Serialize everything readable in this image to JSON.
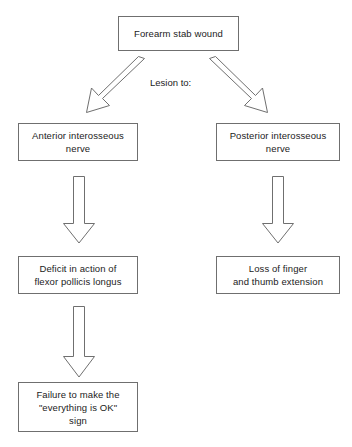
{
  "diagram": {
    "background_color": "#ffffff",
    "box_border_color": "#6f6f6f",
    "text_color": "#1b1b1b",
    "nodes": {
      "root": "Forearm stab wound",
      "left_nerve": "Anterior interosseous\nnerve",
      "right_nerve": "Posterior interosseous\nnerve",
      "left_deficit": "Deficit in action of\nflexor pollicis longus",
      "right_deficit": "Loss of finger\nand thumb extension",
      "left_outcome": "Failure to make the\n\"everything is OK\"\nsign"
    },
    "edge_labels": {
      "lesion_to": "Lesion to:"
    }
  }
}
